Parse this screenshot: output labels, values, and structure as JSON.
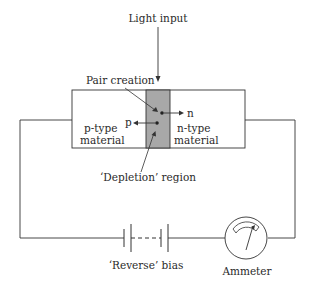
{
  "diagram": {
    "labels": {
      "light_input": "Light input",
      "pair_creation": "Pair creation",
      "p_carrier": "p",
      "n_carrier": "n",
      "p_type_line1": "p-type",
      "p_type_line2": "material",
      "n_type_line1": "n-type",
      "n_type_line2": "material",
      "depletion_region": "‘Depletion’ region",
      "reverse_bias": "‘Reverse’ bias",
      "ammeter": "Ammeter"
    },
    "colors": {
      "line": "#333333",
      "depletion_fill": "#a8a8a8",
      "background": "#ffffff"
    }
  }
}
